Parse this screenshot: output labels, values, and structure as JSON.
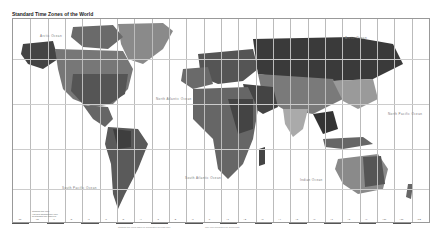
{
  "map": {
    "title": "Standard Time Zones of the World",
    "oceans": [
      {
        "label": "Arctic Ocean",
        "x": 40,
        "y": 34
      },
      {
        "label": "Arctic Ocean",
        "x": 345,
        "y": 36
      },
      {
        "label": "North Atlantic Ocean",
        "x": 156,
        "y": 97
      },
      {
        "label": "North Pacific Ocean",
        "x": 388,
        "y": 112
      },
      {
        "label": "South Pacific Ocean",
        "x": 62,
        "y": 186
      },
      {
        "label": "South Atlantic Ocean",
        "x": 185,
        "y": 176
      },
      {
        "label": "Indian Ocean",
        "x": 300,
        "y": 178
      }
    ],
    "zone_offsets_bottom": [
      "-11",
      "-10",
      "-9",
      "-8",
      "-7",
      "-6",
      "-5",
      "-4",
      "-3",
      "-2",
      "-1",
      "0",
      "+1",
      "+2",
      "+3",
      "+4",
      "+5",
      "+6",
      "+7",
      "+8",
      "+9",
      "+10",
      "+11",
      "+12"
    ],
    "legend_lines": [
      "Standard time zone",
      "Half-hour standard time zone",
      "No standard time observed"
    ],
    "footer_left": "Standard time zones based on Coordinated Universal Time",
    "footer_right": "Time zone boundaries are approximate",
    "credit": "Map"
  }
}
